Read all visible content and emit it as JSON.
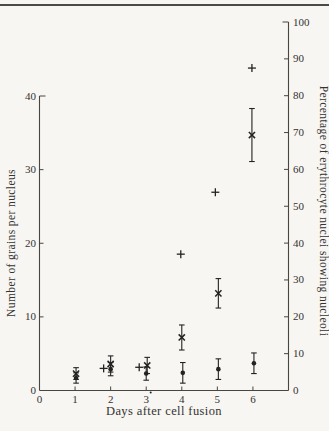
{
  "figure": {
    "background": "#f7f6f3",
    "ink": "#232321",
    "axis_color": "#47463f",
    "text_color": "#34332f",
    "top_rule_color": "#4a4a47"
  },
  "chart_data": {
    "type": "scatter",
    "x_axis": {
      "label": "Days after cell fusion",
      "ticks": [
        0,
        1,
        2,
        3,
        4,
        5,
        6
      ],
      "range": [
        0,
        7
      ]
    },
    "left_axis": {
      "label": "Number of grains per nucleus",
      "ticks": [
        0,
        10,
        20,
        30,
        40
      ],
      "range": [
        0,
        40
      ]
    },
    "right_axis": {
      "label": "Percentage of erythrocyte nuclei showing nucleoli",
      "ticks": [
        0,
        10,
        20,
        30,
        40,
        50,
        60,
        70,
        80,
        90,
        100
      ],
      "range": [
        0,
        100
      ]
    },
    "series": [
      {
        "name": "cross-series",
        "marker": "cross",
        "axis": "left",
        "error_bars": true,
        "points": [
          {
            "day": 1,
            "value": 2.3,
            "err": 0.8,
            "dx": 1
          },
          {
            "day": 2,
            "value": 3.6,
            "err": 1.1,
            "dx": 0
          },
          {
            "day": 3,
            "value": 3.4,
            "err": 1.1,
            "dx": 1
          },
          {
            "day": 4,
            "value": 7.2,
            "err": 1.7,
            "dx": 0
          },
          {
            "day": 5,
            "value": 13.2,
            "err": 2.0,
            "dx": 1
          },
          {
            "day": 6,
            "value": 34.7,
            "err": 3.6,
            "dx": -1
          }
        ]
      },
      {
        "name": "dot-series",
        "marker": "dot",
        "axis": "left",
        "error_bars": true,
        "points": [
          {
            "day": 1,
            "value": 1.7,
            "err": 0.7,
            "dx": 1
          },
          {
            "day": 2,
            "value": 2.9,
            "err": 0.9,
            "dx": 0
          },
          {
            "day": 3,
            "value": 2.3,
            "err": 0.9,
            "dx": 0
          },
          {
            "day": 4,
            "value": 2.4,
            "err": 1.4,
            "dx": 1
          },
          {
            "day": 5,
            "value": 2.9,
            "err": 1.4,
            "dx": 1
          },
          {
            "day": 6,
            "value": 3.7,
            "err": 1.4,
            "dx": 1
          }
        ]
      },
      {
        "name": "plus-series",
        "marker": "plus",
        "axis": "right",
        "error_bars": false,
        "points": [
          {
            "day": 2,
            "value": 6.0,
            "dx": -7
          },
          {
            "day": 3,
            "value": 6.3,
            "dx": -7
          },
          {
            "day": 4,
            "value": 37.0,
            "dx": -1
          },
          {
            "day": 5,
            "value": 53.8,
            "dx": -2
          },
          {
            "day": 6,
            "value": 87.5,
            "dx": -1
          }
        ]
      }
    ],
    "annotations": {
      "tick3_print_dot": true
    }
  }
}
